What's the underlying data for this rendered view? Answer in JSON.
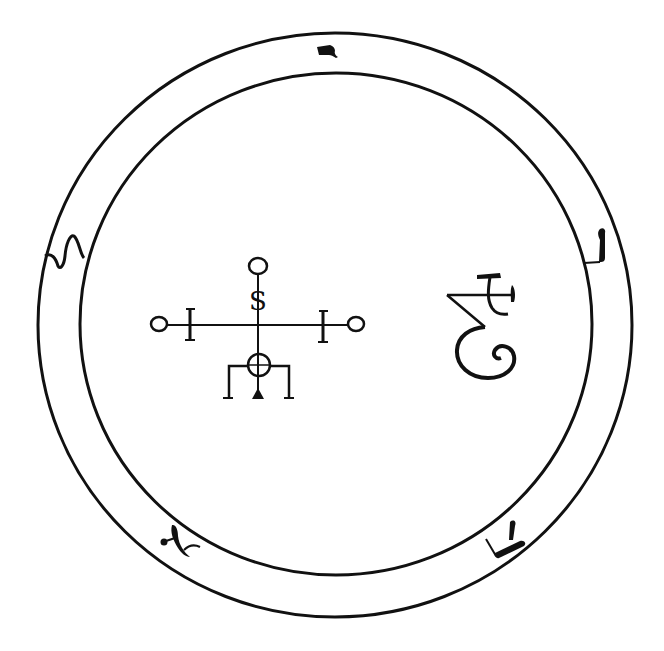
{
  "colors": {
    "ink": "#111111",
    "background": "#ffffff"
  },
  "seal": {
    "outer_ring": {
      "cx": 335,
      "cy": 325,
      "rx": 297,
      "ry": 292
    },
    "inner_ring": {
      "cx": 336,
      "cy": 324,
      "rx": 256,
      "ry": 251
    },
    "ring_letters": [
      {
        "name": "letter-top",
        "position": "top"
      },
      {
        "name": "letter-left",
        "position": "left"
      },
      {
        "name": "letter-right",
        "position": "right"
      },
      {
        "name": "letter-bottom-left",
        "position": "bottom-left"
      },
      {
        "name": "letter-bottom-right",
        "position": "bottom-right"
      }
    ],
    "center_sigil": {
      "letter": "S",
      "description": "cross with circles at ends, bars, and circle-cross base with three legs"
    },
    "right_sigil": {
      "description": "cursive glyph with crossbar and spiral"
    }
  }
}
